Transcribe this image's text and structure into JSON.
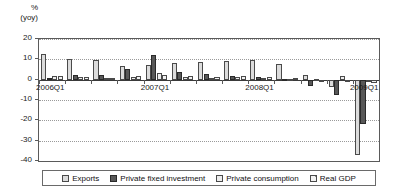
{
  "axis": {
    "unit_line1": "%",
    "unit_line2": "(yoy)",
    "y_ticks": [
      "20",
      "10",
      "0",
      "-10",
      "-20",
      "-30",
      "-40"
    ],
    "ylim": [
      -40,
      20
    ],
    "x_labels": [
      "2006Q1",
      "2007Q1",
      "2008Q1",
      "2009Q1"
    ]
  },
  "legend": {
    "items": [
      {
        "label": "Exports",
        "swatch": "exports-swatch",
        "color": "#dcdcdc"
      },
      {
        "label": "Private fixed investment",
        "swatch": "private-fixed-investment-swatch",
        "color": "#585858"
      },
      {
        "label": "Private consumption",
        "swatch": "private-consumption-swatch",
        "color": "#ededed"
      },
      {
        "label": "Real GDP",
        "swatch": "real-gdp-swatch",
        "color": "#f2f2f2"
      }
    ]
  },
  "chart_data": {
    "type": "bar",
    "title": "",
    "xlabel": "",
    "ylabel": "% (yoy)",
    "ylim": [
      -40,
      20
    ],
    "grid": true,
    "legend_position": "bottom",
    "categories": [
      "2006Q1",
      "2006Q2",
      "2006Q3",
      "2006Q4",
      "2007Q1",
      "2007Q2",
      "2007Q3",
      "2007Q4",
      "2008Q1",
      "2008Q2",
      "2008Q3",
      "2008Q4",
      "2009Q1"
    ],
    "tick_labelled": [
      "2006Q1",
      "2007Q1",
      "2008Q1",
      "2009Q1"
    ],
    "series": [
      {
        "name": "Exports",
        "color": "#dcdcdc",
        "values": [
          12.5,
          10.3,
          9.6,
          6.5,
          7.0,
          8.2,
          8.6,
          9.3,
          9.8,
          7.8,
          2.5,
          -3.4,
          -37.0
        ]
      },
      {
        "name": "Private fixed investment",
        "color": "#585858",
        "values": [
          0.6,
          2.1,
          2.3,
          5.2,
          11.9,
          3.9,
          2.8,
          1.8,
          1.2,
          0.5,
          -2.9,
          -7.5,
          -21.8
        ]
      },
      {
        "name": "Private consumption",
        "color": "#ededed",
        "values": [
          1.7,
          1.2,
          0.7,
          1.3,
          3.2,
          1.4,
          1.0,
          1.3,
          0.9,
          0.4,
          0.3,
          1.6,
          -1.1
        ]
      },
      {
        "name": "Real GDP",
        "color": "#f2f2f2",
        "values": [
          1.9,
          1.5,
          1.0,
          1.8,
          2.4,
          1.8,
          1.5,
          1.6,
          1.2,
          0.7,
          -0.3,
          -1.0,
          -1.4
        ]
      }
    ]
  }
}
